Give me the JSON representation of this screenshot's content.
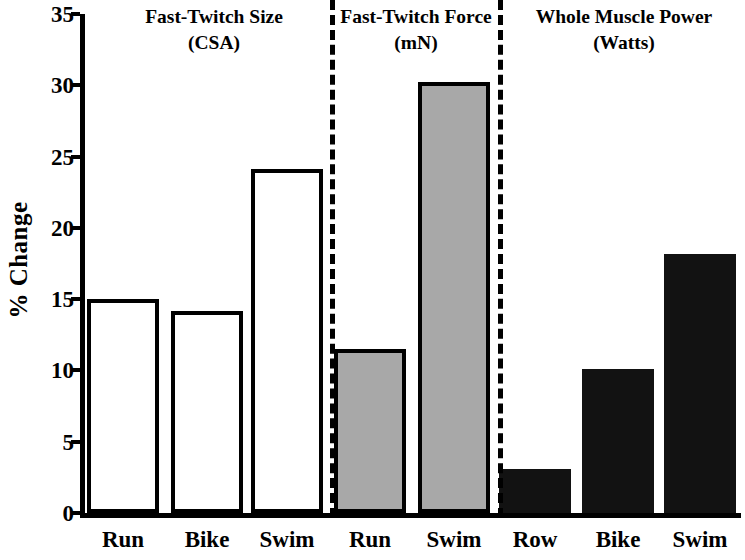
{
  "chart_data": {
    "type": "bar",
    "title": "",
    "xlabel": "",
    "ylabel": "% Change",
    "ylim": [
      0,
      35
    ],
    "yticks": [
      0,
      5,
      10,
      15,
      20,
      25,
      30,
      35
    ],
    "grid": false,
    "legend": "none",
    "panels": [
      {
        "title_line1": "Fast-Twitch Size",
        "title_line2": "(CSA)",
        "fill_style": "open",
        "fill_color": "#ffffff",
        "categories": [
          "Run",
          "Bike",
          "Swim"
        ],
        "values": [
          15.0,
          14.2,
          24.1
        ]
      },
      {
        "title_line1": "Fast-Twitch Force",
        "title_line2": "(mN)",
        "fill_style": "gray",
        "fill_color": "#a8a8a8",
        "categories": [
          "Run",
          "Swim"
        ],
        "values": [
          11.5,
          30.2
        ]
      },
      {
        "title_line1": "Whole Muscle Power",
        "title_line2": "(Watts)",
        "fill_style": "solid",
        "fill_color": "#121212",
        "categories": [
          "Row",
          "Bike",
          "Swim"
        ],
        "values": [
          3.1,
          10.1,
          18.2
        ]
      }
    ],
    "categories": [
      "Run",
      "Bike",
      "Swim",
      "Run",
      "Swim",
      "Row",
      "Bike",
      "Swim"
    ],
    "values": [
      15.0,
      14.2,
      24.1,
      11.5,
      30.2,
      3.1,
      10.1,
      18.2
    ]
  },
  "axis": {
    "ylabel": "% Change",
    "ytick_labels": [
      "35",
      "30",
      "25",
      "20",
      "15",
      "10",
      "5",
      "0"
    ]
  },
  "xticks": [
    {
      "label": "Run"
    },
    {
      "label": "Bike"
    },
    {
      "label": "Swim"
    },
    {
      "label": "Run"
    },
    {
      "label": "Swim"
    },
    {
      "label": "Row"
    },
    {
      "label": "Bike"
    },
    {
      "label": "Swim"
    }
  ]
}
